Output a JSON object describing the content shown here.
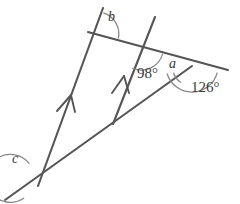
{
  "figure": {
    "kind": "geometry-diagram",
    "stroke_color": "#555555",
    "text_color": "#3a3a3a",
    "background": "#ffffff",
    "width": 240,
    "height": 204
  },
  "labels": {
    "b": "b",
    "a": "a",
    "c": "c",
    "angle_98": "98°",
    "angle_126": "126°"
  },
  "geometry": {
    "lines": [
      {
        "name": "left-parallel-line",
        "x1": 103,
        "y1": 8,
        "x2": 38,
        "y2": 186,
        "parallel_mark": true
      },
      {
        "name": "middle-parallel-line",
        "x1": 155,
        "y1": 17,
        "x2": 113,
        "y2": 124,
        "parallel_mark": true
      },
      {
        "name": "top-transversal-line",
        "x1": 88,
        "y1": 32,
        "x2": 228,
        "y2": 70
      },
      {
        "name": "bottom-transversal-line",
        "x1": 5,
        "y1": 200,
        "x2": 192,
        "y2": 66
      }
    ],
    "vertices": [
      {
        "name": "vertex-b",
        "x": 97,
        "y": 34
      },
      {
        "name": "vertex-98",
        "x": 141,
        "y": 48
      },
      {
        "name": "vertex-a",
        "x": 192,
        "y": 66
      },
      {
        "name": "vertex-c",
        "x": 38,
        "y": 186
      },
      {
        "name": "vertex-middle-bottom",
        "x": 113,
        "y": 124
      }
    ],
    "arcs": [
      {
        "name": "arc-b",
        "cx": 97,
        "cy": 34,
        "r": 22
      },
      {
        "name": "arc-98",
        "cx": 141,
        "cy": 48,
        "r": 22
      },
      {
        "name": "arc-a",
        "cx": 192,
        "cy": 66,
        "r": 20
      },
      {
        "name": "arc-126",
        "cx": 192,
        "cy": 66,
        "r": 26
      },
      {
        "name": "arc-c",
        "cx": 38,
        "cy": 186,
        "r": 24
      }
    ]
  },
  "label_positions": {
    "b": {
      "x": 108,
      "y": 10
    },
    "angle_98": {
      "x": 139,
      "y": 66
    },
    "a": {
      "x": 169,
      "y": 57
    },
    "angle_126": {
      "x": 193,
      "y": 80
    },
    "c": {
      "x": 12,
      "y": 152
    }
  }
}
